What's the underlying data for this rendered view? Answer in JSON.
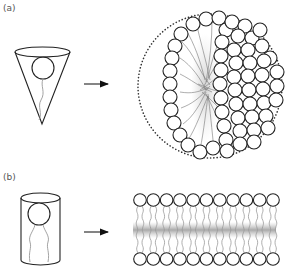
{
  "panels": [
    {
      "label": "(a)",
      "shape": "cone",
      "result": "micelle",
      "arrow": "right-arrow"
    },
    {
      "label": "(b)",
      "shape": "cylinder",
      "result": "bilayer",
      "arrow": "right-arrow"
    }
  ],
  "colors": {
    "line": "#222222",
    "tail": "#888888",
    "dotted": "#333333",
    "background": "#ffffff"
  },
  "bilayer": {
    "columns": 11,
    "head_radius": 6.3,
    "x_start": 140,
    "x_spacing": 13.3,
    "top_y": 200,
    "bottom_y": 259
  }
}
